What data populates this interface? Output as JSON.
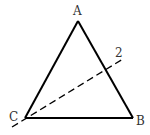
{
  "diagram": {
    "type": "geometry-triangle",
    "vertices": [
      {
        "id": "A",
        "label": "A"
      },
      {
        "id": "B",
        "label": "B"
      },
      {
        "id": "C",
        "label": "C"
      }
    ],
    "edges": [
      {
        "from": "A",
        "to": "B",
        "style": "solid"
      },
      {
        "from": "B",
        "to": "C",
        "style": "solid"
      },
      {
        "from": "C",
        "to": "A",
        "style": "solid"
      }
    ],
    "lines": [
      {
        "label": "2",
        "style": "dashed",
        "passes_through": "C"
      }
    ],
    "colors": {
      "stroke": "#000000",
      "label": "#333333"
    }
  }
}
